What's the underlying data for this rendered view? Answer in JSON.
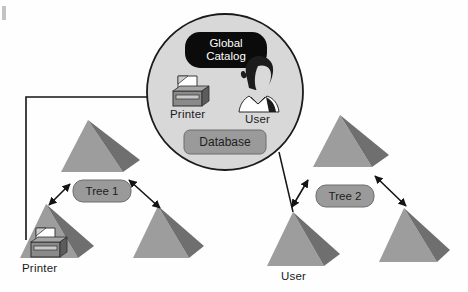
{
  "figure": {
    "type": "diagram",
    "background_color": "#fefefe"
  },
  "colors": {
    "pyramid_light": "#9d9d9d",
    "pyramid_dark": "#6f6f6f",
    "circle_fill": "#d8d8d8",
    "circle_stroke": "#1a1a1a",
    "global_catalog_fill": "#0b0b0b",
    "global_catalog_text": "#ffffff",
    "pill_fill": "#9a9a9a",
    "pill_stroke": "#6d6d6d",
    "line": "#141414",
    "printer_body": "#8a8a8a",
    "printer_dark": "#5c5c5c",
    "paper": "#ffffff",
    "hair": "#1c1c1c",
    "skin": "#d9d9d9"
  },
  "global_catalog": {
    "line1": "Global",
    "line2": "Catalog"
  },
  "circle_items": [
    {
      "id": "printer",
      "label": "Printer",
      "icon": "printer-icon"
    },
    {
      "id": "user",
      "label": "User",
      "icon": "user-person-icon"
    },
    {
      "id": "database",
      "label": "Database",
      "icon": "database-pill"
    }
  ],
  "trees": [
    {
      "id": "tree-1",
      "label": "Tree 1",
      "nodes": [
        {
          "id": "tree1-root",
          "label": ""
        },
        {
          "id": "tree1-child-left",
          "label": "Printer",
          "icon": "printer-icon"
        },
        {
          "id": "tree1-child-right",
          "label": ""
        }
      ]
    },
    {
      "id": "tree-2",
      "label": "Tree 2",
      "nodes": [
        {
          "id": "tree2-root",
          "label": ""
        },
        {
          "id": "tree2-child-left",
          "label": "User"
        },
        {
          "id": "tree2-child-right",
          "label": ""
        }
      ]
    }
  ],
  "connections": [
    {
      "id": "printer-to-catalog",
      "from": "tree1-child-left",
      "to": "circle-printer",
      "style": "single-arrow"
    },
    {
      "id": "catalog-to-user",
      "from": "circle-user",
      "to": "tree2-child-left",
      "style": "plain-line"
    },
    {
      "id": "tree1-root-to-left",
      "style": "double-arrow"
    },
    {
      "id": "tree1-root-to-right",
      "style": "double-arrow"
    },
    {
      "id": "tree2-root-to-left",
      "style": "double-arrow"
    },
    {
      "id": "tree2-root-to-right",
      "style": "double-arrow"
    }
  ],
  "labels": {
    "printer_circle": "Printer",
    "user_circle": "User",
    "database": "Database",
    "tree1": "Tree 1",
    "tree2": "Tree 2",
    "printer_bottom": "Printer",
    "user_bottom": "User"
  }
}
